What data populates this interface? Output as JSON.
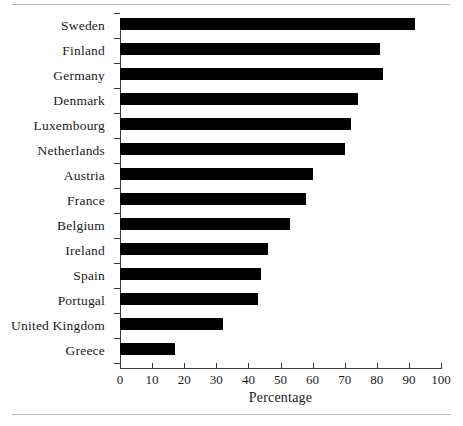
{
  "figure": {
    "has_top_rule": true,
    "has_bottom_rule": true,
    "rule_color": "#b9b9b9",
    "bar_color": "#000000",
    "axis_color": "#3a3a3a",
    "background": "#ffffff"
  },
  "chart_data": {
    "type": "bar",
    "orientation": "horizontal",
    "title": "",
    "subtitle": "",
    "xlabel": "Percentage",
    "ylabel": "",
    "xlim": [
      0,
      100
    ],
    "xticks": [
      0,
      10,
      20,
      30,
      40,
      50,
      60,
      70,
      80,
      90,
      100
    ],
    "xticklabels": [
      "0",
      "10",
      "20",
      "30",
      "40",
      "50",
      "60",
      "70",
      "80",
      "90",
      "100"
    ],
    "grid": false,
    "legend": null,
    "categories": [
      "Sweden",
      "Finland",
      "Germany",
      "Denmark",
      "Luxembourg",
      "Netherlands",
      "Austria",
      "France",
      "Belgium",
      "Ireland",
      "Spain",
      "Portugal",
      "United Kingdom",
      "Greece"
    ],
    "values": [
      92,
      81,
      82,
      74,
      72,
      70,
      60,
      58,
      53,
      46,
      44,
      43,
      32,
      17
    ]
  }
}
